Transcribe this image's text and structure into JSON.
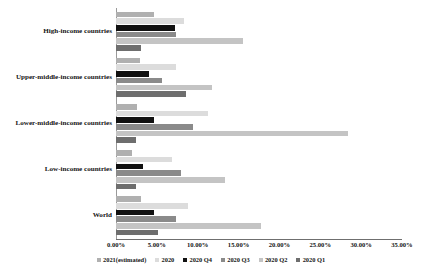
{
  "chart_data": {
    "type": "bar",
    "orientation": "horizontal",
    "title": "",
    "xlabel": "",
    "ylabel": "",
    "xlim": [
      0,
      35
    ],
    "xticks": [
      "0.00%",
      "5.00%",
      "10.00%",
      "15.00%",
      "20.00%",
      "25.00%",
      "30.00%",
      "35.00%"
    ],
    "xtick_values": [
      0,
      5,
      10,
      15,
      20,
      25,
      30,
      35
    ],
    "grid": false,
    "legend_position": "bottom",
    "value_format": "percent",
    "categories": [
      "High-income countries",
      "Upper-middle-income countries",
      "Lower-middle-income countries",
      "Low-income countries",
      "World"
    ],
    "series": [
      {
        "name": "2021(estimated)",
        "color": "#b0b0b0",
        "values": [
          4.7,
          2.9,
          2.6,
          1.9,
          3.0
        ]
      },
      {
        "name": "2020",
        "color": "#dcdcdc",
        "values": [
          8.3,
          7.3,
          11.3,
          6.8,
          8.8
        ]
      },
      {
        "name": "2020 Q4",
        "color": "#111111",
        "values": [
          7.2,
          4.0,
          4.6,
          3.3,
          4.7
        ]
      },
      {
        "name": "2020 Q3",
        "color": "#8a8a8a",
        "values": [
          7.4,
          5.6,
          9.4,
          7.9,
          7.4
        ]
      },
      {
        "name": "2020 Q2",
        "color": "#c4c4c4",
        "values": [
          15.6,
          11.7,
          28.4,
          13.4,
          17.7
        ]
      },
      {
        "name": "2020 Q1",
        "color": "#6e6e6e",
        "values": [
          3.0,
          8.6,
          2.5,
          2.5,
          5.2
        ]
      }
    ]
  },
  "legend": {
    "items": [
      "2021(estimated)",
      "2020",
      "2020 Q4",
      "2020 Q3",
      "2020 Q2",
      "2020 Q1"
    ]
  },
  "caption": {
    "text": ""
  },
  "colors": {
    "axis": "#6f6f6f",
    "text": "#151515",
    "background": "#ffffff"
  }
}
